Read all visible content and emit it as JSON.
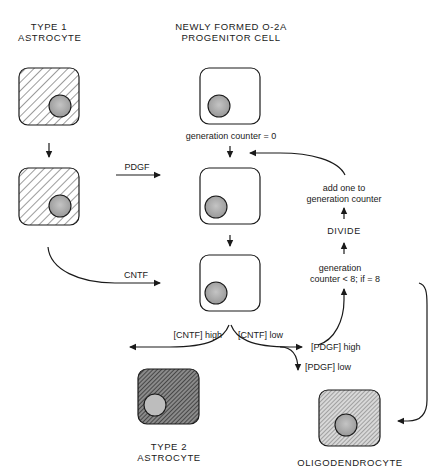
{
  "columns": {
    "left_header": [
      "TYPE 1",
      "ASTROCYTE"
    ],
    "center_header": [
      "NEWLY FORMED O-2A",
      "PROGENITOR CELL"
    ]
  },
  "cells": [
    {
      "id": "type1-astrocyte-top",
      "kind": "type1-astrocyte",
      "fill": "light-hatch"
    },
    {
      "id": "type1-astrocyte-bottom",
      "kind": "type1-astrocyte",
      "fill": "light-hatch"
    },
    {
      "id": "progenitor-1",
      "kind": "o2a-progenitor",
      "fill": "none"
    },
    {
      "id": "progenitor-2",
      "kind": "o2a-progenitor",
      "fill": "none"
    },
    {
      "id": "progenitor-3",
      "kind": "o2a-progenitor",
      "fill": "none"
    },
    {
      "id": "type2-astrocyte",
      "kind": "type2-astrocyte",
      "fill": "dark-hatch"
    },
    {
      "id": "oligodendrocyte",
      "kind": "oligodendrocyte",
      "fill": "fine-hatch"
    }
  ],
  "labels": {
    "generation_counter_zero": "generation counter = 0",
    "pdgf": "PDGF",
    "cntf": "CNTF",
    "add_one": [
      "add one to",
      "generation counter"
    ],
    "divide": "DIVIDE",
    "counter_condition": [
      "generation",
      "counter < 8;  if = 8"
    ],
    "cntf_high": "[CNTF]  high",
    "cntf_low": "[CNTF]  low",
    "pdgf_high": "[PDGF]  high",
    "pdgf_low": "[PDGF]  low",
    "type2_astrocyte": [
      "TYPE 2",
      "ASTROCYTE"
    ],
    "oligodendrocyte": "OLIGODENDROCYTE"
  },
  "colors": {
    "line": "#1a1a1a",
    "nucleus": "#a8a8a8",
    "hatch_light": "#555555",
    "hatch_dark": "#2a2a2a"
  }
}
